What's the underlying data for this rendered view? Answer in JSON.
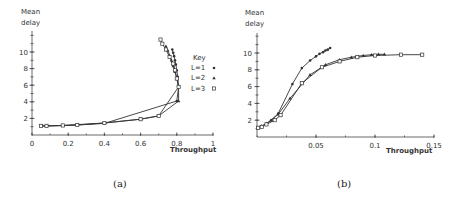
{
  "chart_data": [
    {
      "id": "a",
      "type": "line",
      "caption": "(a)",
      "ylabel": "Mean delay",
      "xlabel": "Throughput",
      "xlim": [
        0,
        1
      ],
      "ylim": [
        0,
        12
      ],
      "xticks": [
        "0",
        "0.2",
        "0.4",
        "0.6",
        "0.8",
        "1"
      ],
      "yticks": [
        "2",
        "4",
        "6",
        "8",
        "10"
      ],
      "grid": false,
      "legend": {
        "title": "Key",
        "position": "right",
        "entries": [
          "L=1",
          "L=2",
          "L=3"
        ]
      },
      "series": [
        {
          "name": "L=1",
          "marker": "circle-filled",
          "points": [
            [
              0.05,
              1.1
            ],
            [
              0.08,
              1.1
            ],
            [
              0.17,
              1.15
            ],
            [
              0.25,
              1.2
            ],
            [
              0.4,
              1.4
            ],
            [
              0.8,
              4.1
            ],
            [
              0.81,
              5.8
            ],
            [
              0.805,
              7.0
            ],
            [
              0.8,
              7.8
            ],
            [
              0.795,
              8.5
            ],
            [
              0.79,
              9.0
            ],
            [
              0.785,
              9.5
            ],
            [
              0.78,
              9.9
            ],
            [
              0.775,
              10.3
            ]
          ]
        },
        {
          "name": "L=2",
          "marker": "triangle",
          "points": [
            [
              0.05,
              1.1
            ],
            [
              0.08,
              1.1
            ],
            [
              0.17,
              1.15
            ],
            [
              0.25,
              1.25
            ],
            [
              0.4,
              1.45
            ],
            [
              0.6,
              1.9
            ],
            [
              0.7,
              2.3
            ],
            [
              0.81,
              4.1
            ],
            [
              0.81,
              5.8
            ],
            [
              0.8,
              6.8
            ],
            [
              0.79,
              7.6
            ],
            [
              0.78,
              8.3
            ],
            [
              0.77,
              9.0
            ],
            [
              0.76,
              9.6
            ],
            [
              0.75,
              10.2
            ],
            [
              0.74,
              10.7
            ]
          ]
        },
        {
          "name": "L=3",
          "marker": "square-open",
          "points": [
            [
              0.05,
              1.1
            ],
            [
              0.08,
              1.1
            ],
            [
              0.17,
              1.15
            ],
            [
              0.25,
              1.2
            ],
            [
              0.4,
              1.45
            ],
            [
              0.6,
              1.9
            ],
            [
              0.7,
              2.3
            ],
            [
              0.81,
              5.8
            ],
            [
              0.8,
              6.8
            ],
            [
              0.79,
              7.8
            ],
            [
              0.78,
              8.6
            ],
            [
              0.76,
              9.4
            ],
            [
              0.74,
              10.3
            ],
            [
              0.72,
              11.0
            ],
            [
              0.71,
              11.5
            ]
          ]
        }
      ]
    },
    {
      "id": "b",
      "type": "line",
      "caption": "(b)",
      "ylabel": "Mean delay",
      "xlabel": "Throughput",
      "xlim": [
        0,
        0.15
      ],
      "ylim": [
        0,
        12
      ],
      "xticks": [
        "0.05",
        "0.1",
        "0.15"
      ],
      "yticks": [
        "2",
        "4",
        "6",
        "8",
        "10"
      ],
      "grid": false,
      "series": [
        {
          "name": "L=1",
          "marker": "circle-filled",
          "points": [
            [
              0.001,
              1.1
            ],
            [
              0.004,
              1.3
            ],
            [
              0.008,
              1.6
            ],
            [
              0.012,
              2.0
            ],
            [
              0.018,
              2.8
            ],
            [
              0.03,
              6.3
            ],
            [
              0.038,
              8.2
            ],
            [
              0.045,
              9.1
            ],
            [
              0.05,
              9.6
            ],
            [
              0.053,
              9.9
            ],
            [
              0.056,
              10.1
            ],
            [
              0.058,
              10.3
            ],
            [
              0.06,
              10.4
            ],
            [
              0.062,
              10.6
            ]
          ]
        },
        {
          "name": "L=2",
          "marker": "triangle",
          "points": [
            [
              0.001,
              1.1
            ],
            [
              0.004,
              1.3
            ],
            [
              0.008,
              1.6
            ],
            [
              0.012,
              2.0
            ],
            [
              0.018,
              2.7
            ],
            [
              0.028,
              4.6
            ],
            [
              0.045,
              7.4
            ],
            [
              0.058,
              8.6
            ],
            [
              0.07,
              9.2
            ],
            [
              0.08,
              9.5
            ],
            [
              0.09,
              9.7
            ],
            [
              0.097,
              9.8
            ],
            [
              0.103,
              9.85
            ],
            [
              0.108,
              9.85
            ]
          ]
        },
        {
          "name": "L=3",
          "marker": "square-open",
          "points": [
            [
              0.001,
              1.1
            ],
            [
              0.004,
              1.2
            ],
            [
              0.008,
              1.5
            ],
            [
              0.015,
              2.0
            ],
            [
              0.02,
              2.6
            ],
            [
              0.038,
              6.4
            ],
            [
              0.055,
              8.3
            ],
            [
              0.07,
              9.0
            ],
            [
              0.085,
              9.5
            ],
            [
              0.1,
              9.7
            ],
            [
              0.122,
              9.8
            ],
            [
              0.14,
              9.8
            ]
          ]
        }
      ]
    }
  ],
  "figure": {
    "a": {
      "caption": "(a)",
      "ylabel_line1": "Mean",
      "ylabel_line2": "delay",
      "xlabel": "Throughput",
      "legend_title": "Key",
      "legend": [
        "L=1",
        "L=2",
        "L=3"
      ]
    },
    "b": {
      "caption": "(b)",
      "ylabel_line1": "Mean",
      "ylabel_line2": "delay",
      "xlabel": "Throughput"
    }
  }
}
